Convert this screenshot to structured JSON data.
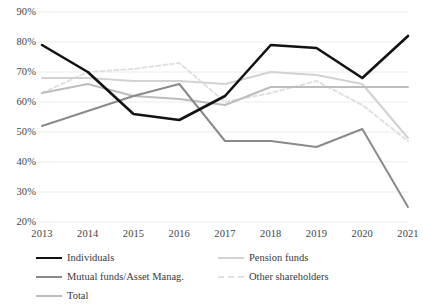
{
  "chart_data": {
    "type": "line",
    "title": "",
    "subtitle": "",
    "xlabel": "",
    "ylabel": "",
    "categories": [
      "2013",
      "2014",
      "2015",
      "2016",
      "2017",
      "2018",
      "2019",
      "2020",
      "2021"
    ],
    "x": [
      2013,
      2014,
      2015,
      2016,
      2017,
      2018,
      2019,
      2020,
      2021
    ],
    "ylim": [
      20,
      90
    ],
    "yticks": [
      20,
      30,
      40,
      50,
      60,
      70,
      80,
      90
    ],
    "ytick_labels": [
      "20%",
      "30%",
      "40%",
      "50%",
      "60%",
      "70%",
      "80%",
      "90%"
    ],
    "grid": "horizontal",
    "legend_position": "bottom",
    "series": [
      {
        "name": "Individuals",
        "color": "#121212",
        "width": 2.6,
        "dash": "",
        "values": [
          79,
          70,
          56,
          54,
          62,
          79,
          78,
          68,
          82
        ]
      },
      {
        "name": "Mutual funds/Asset Manag.",
        "color": "#8a8a8a",
        "width": 2.0,
        "dash": "",
        "values": [
          52,
          57,
          62,
          66,
          47,
          47,
          45,
          51,
          25
        ]
      },
      {
        "name": "Total",
        "color": "#bdbdbd",
        "width": 2.0,
        "dash": "",
        "values": [
          63,
          66,
          62,
          61,
          59,
          65,
          65,
          65,
          65
        ]
      },
      {
        "name": "Pension funds",
        "color": "#d2d2d2",
        "width": 2.0,
        "dash": "",
        "values": [
          68,
          68,
          67,
          67,
          66,
          70,
          69,
          66,
          48
        ]
      },
      {
        "name": "Other shareholders",
        "color": "#e0e0e0",
        "width": 2.0,
        "dash": "4 3",
        "values": [
          63,
          70,
          71,
          73,
          60,
          63,
          67,
          59,
          47
        ]
      }
    ]
  },
  "axis": {
    "y_ticks": [
      "90%",
      "80%",
      "70%",
      "60%",
      "50%",
      "40%",
      "30%",
      "20%"
    ],
    "x_ticks": [
      "2013",
      "2014",
      "2015",
      "2016",
      "2017",
      "2018",
      "2019",
      "2020",
      "2021"
    ]
  },
  "legend": {
    "items": [
      {
        "label": "Individuals",
        "color": "#121212",
        "dash": "",
        "width": 2.6
      },
      {
        "label": "Pension funds",
        "color": "#d2d2d2",
        "dash": "",
        "width": 2.0
      },
      {
        "label": "Mutual funds/Asset Manag.",
        "color": "#8a8a8a",
        "dash": "",
        "width": 2.0
      },
      {
        "label": "Other shareholders",
        "color": "#e0e0e0",
        "dash": "4 3",
        "width": 2.0
      },
      {
        "label": "Total",
        "color": "#bdbdbd",
        "dash": "",
        "width": 2.0
      }
    ]
  },
  "colors": {
    "background": "#ffffff",
    "gridline": "#ececec",
    "text": "#444444"
  }
}
